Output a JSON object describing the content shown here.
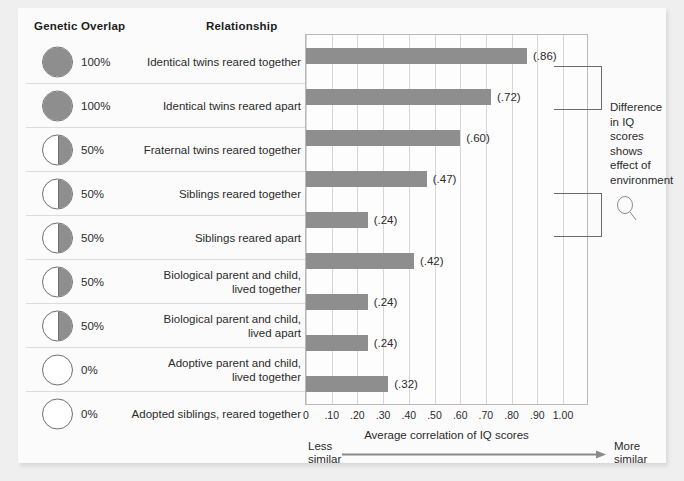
{
  "headers": {
    "genetic_overlap": "Genetic Overlap",
    "relationship": "Relationship"
  },
  "annotation": {
    "text": "Difference\nin IQ\nscores\nshows\neffect of\nenvironment",
    "icon": "magnifier-icon"
  },
  "axis": {
    "title": "Average correlation of IQ scores",
    "less_similar": "Less\nsimilar",
    "more_similar": "More\nsimilar",
    "ticks": [
      "0",
      ".10",
      ".20",
      ".30",
      ".40",
      ".50",
      ".60",
      ".70",
      ".80",
      ".90",
      "1.00"
    ]
  },
  "colors": {
    "bar": "#8e8e8e",
    "grid": "#d6d6d6",
    "frame": "#b9b9b9",
    "card": "#fbfbfb",
    "page": "#efefef",
    "text": "#2b2b2b"
  },
  "chart_data": {
    "type": "bar",
    "title": "",
    "xlabel": "Average correlation of IQ scores",
    "ylabel": "",
    "xlim": [
      0,
      1.0
    ],
    "orientation": "horizontal",
    "grid": true,
    "legend": "none",
    "categories": [
      "Identical twins reared together",
      "Identical twins reared apart",
      "Fraternal twins reared together",
      "Siblings reared together",
      "Siblings reared apart",
      "Biological parent and child,\nlived together",
      "Biological parent and child,\nlived apart",
      "Adoptive parent and child,\nlived together",
      "Adopted siblings, reared together"
    ],
    "values": [
      0.86,
      0.72,
      0.6,
      0.47,
      0.24,
      0.42,
      0.24,
      0.24,
      0.32
    ],
    "value_labels": [
      "(.86)",
      "(.72)",
      "(.60)",
      "(.47)",
      "(.24)",
      "(.42)",
      "(.24)",
      "(.24)",
      "(.32)"
    ],
    "genetic_overlap": [
      "100%",
      "100%",
      "50%",
      "50%",
      "50%",
      "50%",
      "50%",
      "0%",
      "0%"
    ],
    "genetic_overlap_fraction": [
      1.0,
      1.0,
      0.5,
      0.5,
      0.5,
      0.5,
      0.5,
      0.0,
      0.0
    ]
  }
}
